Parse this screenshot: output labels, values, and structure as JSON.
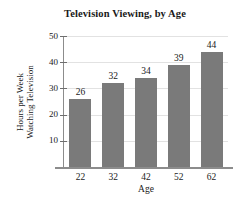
{
  "chart_data": {
    "type": "bar",
    "title": "Television Viewing, by Age",
    "xlabel": "Age",
    "ylabel_lines": [
      "Hours per Week",
      "Watching Television"
    ],
    "ylabel": "Hours per Week Watching Television",
    "categories": [
      "22",
      "32",
      "42",
      "52",
      "62"
    ],
    "values": [
      26,
      32,
      34,
      39,
      44
    ],
    "value_labels": [
      "26",
      "32",
      "34",
      "39",
      "44"
    ],
    "ylim": [
      0,
      50
    ],
    "yticks": [
      10,
      20,
      30,
      40,
      50
    ],
    "ytick_labels": [
      "10",
      "20",
      "30",
      "40",
      "50"
    ],
    "grid": true,
    "grid_axis": "y",
    "legend": false,
    "bar_color": "#7a7a7a",
    "axis_color": "#8c8c8c",
    "grid_color": "#e2e2e2",
    "text_color": "#1a1a1a",
    "background": "#ffffff"
  }
}
